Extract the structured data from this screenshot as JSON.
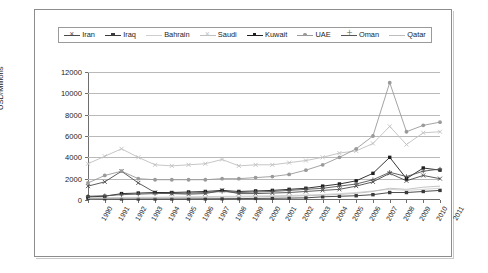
{
  "figure": {
    "cut_off_caption": "",
    "frame": true
  },
  "legend": {
    "position": "top-inside",
    "entries": [
      {
        "label": "Iran",
        "color": "#4b4b4b",
        "marker": "cross"
      },
      {
        "label": "Iraq",
        "color": "#3a3a3a",
        "marker": "square"
      },
      {
        "label": "Bahrain",
        "color": "#cfcfcf",
        "marker": "none"
      },
      {
        "label": "Saudi",
        "color": "#c0c0c0",
        "marker": "cross"
      },
      {
        "label": "Kuwait",
        "color": "#1f1f1f",
        "marker": "square"
      },
      {
        "label": "UAE",
        "color": "#9a9a9a",
        "marker": "circle"
      },
      {
        "label": "Oman",
        "color": "#555555",
        "marker": "plus"
      },
      {
        "label": "Qatar",
        "color": "#bdbdbd",
        "marker": "none"
      }
    ]
  },
  "chart_data": {
    "type": "line",
    "title": "",
    "xlabel": "",
    "ylabel": "USD/Millions",
    "ylim": [
      0,
      12000
    ],
    "ytick_labels": [
      "0",
      "2000",
      "4000",
      "6000",
      "8000",
      "10000",
      "12000"
    ],
    "ytick_values": [
      0,
      2000,
      4000,
      6000,
      8000,
      10000,
      12000
    ],
    "grid": true,
    "legend_position": "top",
    "categories": [
      "1990",
      "1991",
      "1992",
      "1993",
      "1994",
      "1995",
      "1996",
      "1997",
      "1998",
      "1999",
      "2000",
      "2001",
      "2002",
      "2003",
      "2004",
      "2005",
      "2006",
      "2007",
      "2008",
      "2009",
      "2010",
      "2011"
    ],
    "series": [
      {
        "name": "Iran",
        "color": "#4b4b4b",
        "marker": "cross",
        "values": [
          1300,
          1700,
          2700,
          1600,
          700,
          600,
          550,
          600,
          900,
          600,
          600,
          650,
          700,
          800,
          900,
          1000,
          1300,
          1700,
          2500,
          1800,
          2300,
          2000
        ]
      },
      {
        "name": "Iraq",
        "color": "#3a3a3a",
        "marker": "square",
        "values": [
          150,
          120,
          100,
          100,
          100,
          100,
          100,
          110,
          120,
          130,
          150,
          160,
          180,
          200,
          300,
          350,
          400,
          500,
          700,
          700,
          800,
          900
        ]
      },
      {
        "name": "Bahrain",
        "color": "#cfcfcf",
        "marker": "none",
        "values": [
          200,
          220,
          240,
          250,
          260,
          280,
          300,
          320,
          340,
          350,
          380,
          400,
          430,
          470,
          520,
          600,
          700,
          850,
          1000,
          900,
          1000,
          1100
        ]
      },
      {
        "name": "Saudi",
        "color": "#c0c0c0",
        "marker": "cross",
        "values": [
          3400,
          4100,
          4800,
          4000,
          3300,
          3200,
          3300,
          3400,
          3800,
          3200,
          3300,
          3300,
          3500,
          3700,
          4000,
          4400,
          4600,
          5300,
          6900,
          5200,
          6300,
          6400
        ]
      },
      {
        "name": "Kuwait",
        "color": "#1f1f1f",
        "marker": "square",
        "values": [
          300,
          350,
          600,
          650,
          700,
          700,
          750,
          800,
          900,
          800,
          850,
          900,
          1000,
          1100,
          1300,
          1500,
          1800,
          2500,
          4000,
          2000,
          3000,
          2800
        ]
      },
      {
        "name": "UAE",
        "color": "#9a9a9a",
        "marker": "circle",
        "values": [
          1600,
          2300,
          2700,
          2000,
          1900,
          1900,
          1900,
          1900,
          2000,
          2000,
          2100,
          2200,
          2400,
          2800,
          3300,
          4000,
          4800,
          6000,
          11000,
          6400,
          7000,
          7300
        ]
      },
      {
        "name": "Oman",
        "color": "#555555",
        "marker": "plus",
        "values": [
          350,
          400,
          500,
          550,
          600,
          620,
          650,
          700,
          800,
          700,
          750,
          800,
          900,
          1000,
          1100,
          1300,
          1500,
          1900,
          2600,
          2200,
          2700,
          2900
        ]
      },
      {
        "name": "Qatar",
        "color": "#bdbdbd",
        "marker": "none",
        "values": [
          150,
          160,
          180,
          190,
          200,
          210,
          230,
          250,
          280,
          280,
          300,
          330,
          360,
          400,
          450,
          520,
          620,
          800,
          1100,
          1000,
          1200,
          1300
        ]
      }
    ]
  }
}
